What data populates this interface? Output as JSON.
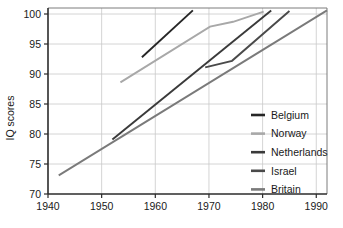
{
  "chart_data": {
    "type": "line",
    "title": "",
    "xlabel": "",
    "ylabel": "IQ scores",
    "xlim": [
      1940,
      1992
    ],
    "ylim": [
      70,
      101
    ],
    "grid": true,
    "legend_position": "right-inside",
    "x_ticks": [
      1940,
      1950,
      1960,
      1970,
      1980,
      1990
    ],
    "y_ticks": [
      70,
      75,
      80,
      85,
      90,
      95,
      100
    ],
    "series": [
      {
        "name": "Belgium",
        "color": "#262626",
        "points": [
          [
            1957.5,
            92.8
          ],
          [
            1967.0,
            100.6
          ]
        ]
      },
      {
        "name": "Norway",
        "color": "#a8a8a8",
        "points": [
          [
            1953.5,
            88.6
          ],
          [
            1970.2,
            97.9
          ],
          [
            1974.5,
            98.7
          ],
          [
            1980.2,
            100.4
          ]
        ]
      },
      {
        "name": "Netherlands",
        "color": "#3a3a3a",
        "points": [
          [
            1952.0,
            79.1
          ],
          [
            1981.6,
            100.6
          ]
        ]
      },
      {
        "name": "Israel",
        "color": "#4a4a4a",
        "points": [
          [
            1969.3,
            91.1
          ],
          [
            1974.3,
            92.2
          ],
          [
            1985.0,
            100.5
          ]
        ]
      },
      {
        "name": "Britain",
        "color": "#7a7a7a",
        "points": [
          [
            1942.0,
            73.1
          ],
          [
            1992.0,
            100.6
          ]
        ]
      }
    ]
  },
  "legend": {
    "entries": [
      {
        "label": "Belgium",
        "color": "#262626"
      },
      {
        "label": "Norway",
        "color": "#a8a8a8"
      },
      {
        "label": "Netherlands",
        "color": "#3a3a3a"
      },
      {
        "label": "Israel",
        "color": "#4a4a4a"
      },
      {
        "label": "Britain",
        "color": "#7a7a7a"
      }
    ]
  }
}
